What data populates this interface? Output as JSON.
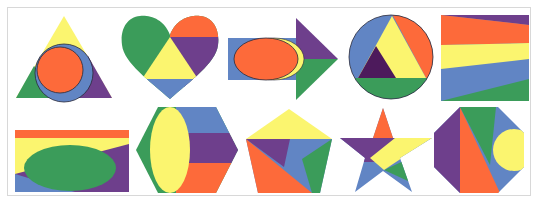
{
  "palette": {
    "yellow": "#fbf56f",
    "orange": "#fd6a3a",
    "blue": "#6185c4",
    "green": "#3b9c5a",
    "purple": "#6e3f8c",
    "dark_purple": "#4d1a5c",
    "outline": "#2a2a3a",
    "frame_border": "#d8d8d8"
  },
  "shapes": [
    {
      "id": 1,
      "name": "triangle",
      "row": 1,
      "col": 1,
      "regions": [
        "yellow",
        "green",
        "purple",
        "blue",
        "orange"
      ],
      "description": "Triangle with blue circle and orange inner circle"
    },
    {
      "id": 2,
      "name": "heart",
      "row": 1,
      "col": 2,
      "regions": [
        "green",
        "orange",
        "purple",
        "yellow",
        "blue"
      ],
      "description": "Heart with central yellow triangle"
    },
    {
      "id": 3,
      "name": "arrow",
      "row": 1,
      "col": 3,
      "regions": [
        "blue",
        "yellow",
        "orange",
        "purple",
        "green"
      ],
      "description": "Right arrow with orange ellipse"
    },
    {
      "id": 4,
      "name": "circle",
      "row": 1,
      "col": 4,
      "regions": [
        "blue",
        "orange",
        "yellow",
        "dark_purple",
        "green"
      ],
      "description": "Circle with inscribed triangle"
    },
    {
      "id": 5,
      "name": "square",
      "row": 1,
      "col": 5,
      "regions": [
        "purple",
        "orange",
        "yellow",
        "blue",
        "green"
      ],
      "description": "Square with diagonal stripes"
    },
    {
      "id": 6,
      "name": "rectangle",
      "row": 2,
      "col": 1,
      "regions": [
        "orange",
        "yellow",
        "purple",
        "blue",
        "green"
      ],
      "description": "Rectangle with green ellipse"
    },
    {
      "id": 7,
      "name": "hexagon",
      "row": 2,
      "col": 2,
      "regions": [
        "green",
        "yellow",
        "blue",
        "purple",
        "orange"
      ],
      "description": "Hexagon with yellow ellipse and horizontal bands"
    },
    {
      "id": 8,
      "name": "pentagon",
      "row": 2,
      "col": 3,
      "regions": [
        "yellow",
        "purple",
        "blue",
        "green",
        "orange"
      ],
      "description": "Pentagon divided into triangles"
    },
    {
      "id": 9,
      "name": "star",
      "row": 2,
      "col": 4,
      "regions": [
        "orange",
        "purple",
        "yellow",
        "blue",
        "green"
      ],
      "description": "Five-pointed star"
    },
    {
      "id": 10,
      "name": "octagon",
      "row": 2,
      "col": 5,
      "regions": [
        "purple",
        "orange",
        "green",
        "blue",
        "yellow"
      ],
      "description": "Octagon with yellow semicircle"
    }
  ]
}
